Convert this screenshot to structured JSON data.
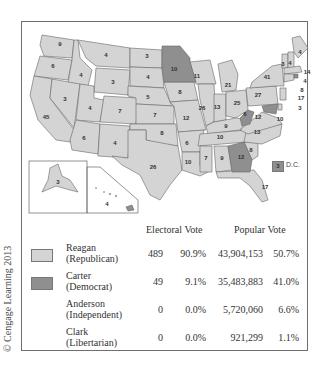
{
  "copyright": "© Cengage Learning 2013",
  "colors": {
    "reagan": "#d4d4d4",
    "carter": "#8f8f8f",
    "border": "#666666"
  },
  "map": {
    "dc": {
      "votes": "3",
      "label": "D.C."
    },
    "states": [
      {
        "abbr": "WA",
        "votes": "9",
        "party": "reagan"
      },
      {
        "abbr": "OR",
        "votes": "6",
        "party": "reagan"
      },
      {
        "abbr": "CA",
        "votes": "45",
        "party": "reagan"
      },
      {
        "abbr": "ID",
        "votes": "4",
        "party": "reagan"
      },
      {
        "abbr": "NV",
        "votes": "3",
        "party": "reagan"
      },
      {
        "abbr": "MT",
        "votes": "4",
        "party": "reagan"
      },
      {
        "abbr": "WY",
        "votes": "3",
        "party": "reagan"
      },
      {
        "abbr": "UT",
        "votes": "4",
        "party": "reagan"
      },
      {
        "abbr": "CO",
        "votes": "7",
        "party": "reagan"
      },
      {
        "abbr": "AZ",
        "votes": "6",
        "party": "reagan"
      },
      {
        "abbr": "NM",
        "votes": "4",
        "party": "reagan"
      },
      {
        "abbr": "ND",
        "votes": "3",
        "party": "reagan"
      },
      {
        "abbr": "SD",
        "votes": "4",
        "party": "reagan"
      },
      {
        "abbr": "NE",
        "votes": "5",
        "party": "reagan"
      },
      {
        "abbr": "KS",
        "votes": "7",
        "party": "reagan"
      },
      {
        "abbr": "OK",
        "votes": "8",
        "party": "reagan"
      },
      {
        "abbr": "TX",
        "votes": "26",
        "party": "reagan"
      },
      {
        "abbr": "MN",
        "votes": "10",
        "party": "carter"
      },
      {
        "abbr": "IA",
        "votes": "8",
        "party": "reagan"
      },
      {
        "abbr": "MO",
        "votes": "12",
        "party": "reagan"
      },
      {
        "abbr": "AR",
        "votes": "6",
        "party": "reagan"
      },
      {
        "abbr": "LA",
        "votes": "10",
        "party": "reagan"
      },
      {
        "abbr": "WI",
        "votes": "11",
        "party": "reagan"
      },
      {
        "abbr": "IL",
        "votes": "26",
        "party": "reagan"
      },
      {
        "abbr": "MI",
        "votes": "21",
        "party": "reagan"
      },
      {
        "abbr": "IN",
        "votes": "13",
        "party": "reagan"
      },
      {
        "abbr": "OH",
        "votes": "25",
        "party": "reagan"
      },
      {
        "abbr": "KY",
        "votes": "9",
        "party": "reagan"
      },
      {
        "abbr": "TN",
        "votes": "10",
        "party": "reagan"
      },
      {
        "abbr": "MS",
        "votes": "7",
        "party": "reagan"
      },
      {
        "abbr": "AL",
        "votes": "9",
        "party": "reagan"
      },
      {
        "abbr": "GA",
        "votes": "12",
        "party": "carter"
      },
      {
        "abbr": "FL",
        "votes": "17",
        "party": "reagan"
      },
      {
        "abbr": "SC",
        "votes": "8",
        "party": "reagan"
      },
      {
        "abbr": "NC",
        "votes": "13",
        "party": "reagan"
      },
      {
        "abbr": "VA",
        "votes": "12",
        "party": "reagan"
      },
      {
        "abbr": "WV",
        "votes": "6",
        "party": "carter"
      },
      {
        "abbr": "PA",
        "votes": "27",
        "party": "reagan"
      },
      {
        "abbr": "NY",
        "votes": "41",
        "party": "reagan"
      },
      {
        "abbr": "VT",
        "votes": "3",
        "party": "reagan"
      },
      {
        "abbr": "NH",
        "votes": "4",
        "party": "reagan"
      },
      {
        "abbr": "ME",
        "votes": "4",
        "party": "reagan"
      },
      {
        "abbr": "MA",
        "votes": "14",
        "party": "reagan"
      },
      {
        "abbr": "RI",
        "votes": "4",
        "party": "carter"
      },
      {
        "abbr": "CT",
        "votes": "8",
        "party": "reagan"
      },
      {
        "abbr": "NJ",
        "votes": "17",
        "party": "reagan"
      },
      {
        "abbr": "DE",
        "votes": "3",
        "party": "reagan"
      },
      {
        "abbr": "MD",
        "votes": "10",
        "party": "carter"
      },
      {
        "abbr": "AK",
        "votes": "3",
        "party": "reagan"
      },
      {
        "abbr": "HI",
        "votes": "4",
        "party": "carter"
      }
    ]
  },
  "table": {
    "electoral_header": "Electoral Vote",
    "popular_header": "Popular Vote",
    "rows": [
      {
        "name": "Reagan",
        "party": "(Republican)",
        "ev": "489",
        "ev_pct": "90.9%",
        "pv": "43,904,153",
        "pv_pct": "50.7%",
        "swatch": "#d4d4d4"
      },
      {
        "name": "Carter",
        "party": "(Democrat)",
        "ev": "49",
        "ev_pct": "9.1%",
        "pv": "35,483,883",
        "pv_pct": "41.0%",
        "swatch": "#8f8f8f"
      },
      {
        "name": "Anderson",
        "party": "(Independent)",
        "ev": "0",
        "ev_pct": "0.0%",
        "pv": "5,720,060",
        "pv_pct": "6.6%",
        "swatch": ""
      },
      {
        "name": "Clark",
        "party": "(Libertarian)",
        "ev": "0",
        "ev_pct": "0.0%",
        "pv": "921,299",
        "pv_pct": "1.1%",
        "swatch": ""
      }
    ]
  }
}
